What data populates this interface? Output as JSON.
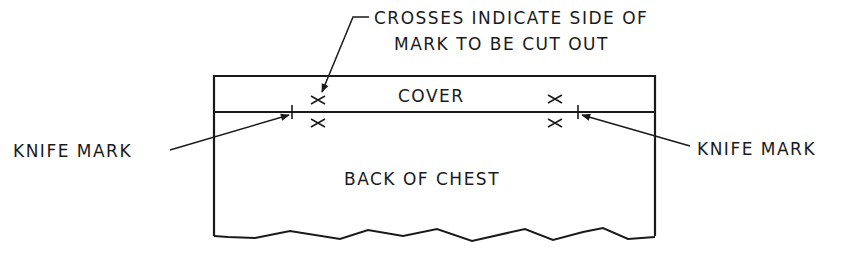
{
  "diagram": {
    "callout": {
      "line1": "CROSSES INDICATE SIDE OF",
      "line2": "MARK TO BE CUT OUT"
    },
    "cover_label": "COVER",
    "body_label": "BACK OF CHEST",
    "left_label": "KNIFE MARK",
    "right_label": "KNIFE MARK",
    "line_color": "#1a1a1a"
  }
}
